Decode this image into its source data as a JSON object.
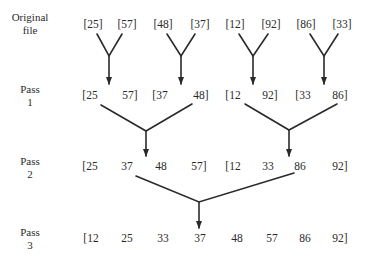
{
  "rows": [
    {
      "label_line1": "Original",
      "label_line2": "file",
      "items": [
        "[25]",
        "[57]",
        "[48]",
        "[37]",
        "[12]",
        "[92]",
        "[86]",
        "[33]"
      ]
    },
    {
      "label_line1": "Pass",
      "label_line2": "1",
      "items": [
        "[25",
        "57]",
        "[37",
        "48]",
        "[12",
        "92]",
        "[33",
        "86]"
      ]
    },
    {
      "label_line1": "Pass",
      "label_line2": "2",
      "items": [
        "[25",
        "37",
        "48",
        "57]",
        "[12",
        "33",
        "86",
        "92]"
      ]
    },
    {
      "label_line1": "Pass",
      "label_line2": "3",
      "items": [
        "[12",
        "25",
        "33",
        "37",
        "48",
        "57",
        "86",
        "92]"
      ]
    }
  ],
  "colors": {
    "line": "#2a2a2a",
    "text": "#2a2a2a",
    "background": "#ffffff"
  }
}
